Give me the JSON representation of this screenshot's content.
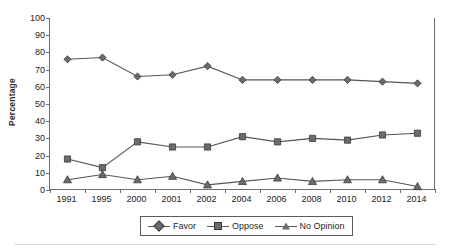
{
  "chart_data": {
    "type": "line",
    "title": "",
    "subtitle": "",
    "xlabel": "",
    "ylabel": "Percentage",
    "categories": [
      "1991",
      "1995",
      "2000",
      "2001",
      "2002",
      "2004",
      "2006",
      "2008",
      "2010",
      "2012",
      "2014"
    ],
    "x": [
      "1991",
      "1995",
      "2000",
      "2001",
      "2002",
      "2004",
      "2006",
      "2008",
      "2010",
      "2012",
      "2014"
    ],
    "series": [
      {
        "name": "Favor",
        "marker": "diamond",
        "color": "#6b6b6b",
        "values": [
          76,
          77,
          66,
          67,
          72,
          64,
          64,
          64,
          64,
          63,
          62
        ]
      },
      {
        "name": "Oppose",
        "marker": "square",
        "color": "#6b6b6b",
        "values": [
          18,
          13,
          28,
          25,
          25,
          31,
          28,
          30,
          29,
          32,
          33
        ]
      },
      {
        "name": "No Opinion",
        "marker": "triangle",
        "color": "#6b6b6b",
        "values": [
          6,
          9,
          6,
          8,
          3,
          5,
          7,
          5,
          6,
          6,
          2
        ]
      }
    ],
    "ylim": [
      0,
      100
    ],
    "yticks": [
      0,
      10,
      20,
      30,
      40,
      50,
      60,
      70,
      80,
      90,
      100
    ],
    "ytick_labels": [
      "0",
      "10",
      "20",
      "30",
      "40",
      "50",
      "60",
      "70",
      "80",
      "90",
      "100"
    ],
    "grid": false,
    "legend_position": "bottom-center",
    "legend_entries": [
      "Favor",
      "Oppose",
      "No Opinion"
    ],
    "line_color": "#555555",
    "axis_color": "#6f6f6f"
  },
  "axis": {
    "y_title": "Percentage"
  },
  "legend": {
    "items": [
      {
        "label": "Favor",
        "icon": "diamond-marker-icon"
      },
      {
        "label": "Oppose",
        "icon": "square-marker-icon"
      },
      {
        "label": "No Opinion",
        "icon": "triangle-marker-icon"
      }
    ]
  }
}
